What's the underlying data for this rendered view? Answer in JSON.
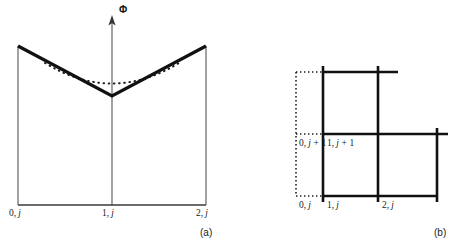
{
  "figure": {
    "panels": [
      {
        "id": "a",
        "caption": "(a)",
        "axis": {
          "vertical_label": "Φ",
          "arrow": "up-arrow-icon"
        },
        "node_labels": [
          {
            "name": "node-0-j",
            "index": "0,",
            "sub": "j"
          },
          {
            "name": "node-1-j",
            "index": "1,",
            "sub": "j"
          },
          {
            "name": "node-2-j",
            "index": "2,",
            "sub": "j"
          }
        ],
        "curves": [
          {
            "name": "piecewise-linear-solution",
            "style": "solid",
            "shape": "v-shape"
          },
          {
            "name": "smooth-exact-solution",
            "style": "dotted",
            "shape": "parabola"
          }
        ]
      },
      {
        "id": "b",
        "caption": "(b)",
        "node_labels": [
          {
            "name": "node-0-jplus1",
            "index": "0,",
            "sub": "j",
            "suffix": " + 1"
          },
          {
            "name": "node-1-jplus1",
            "index": "1,",
            "sub": "j",
            "suffix": " + 1"
          },
          {
            "name": "node-0-j",
            "index": "0,",
            "sub": "j",
            "suffix": ""
          },
          {
            "name": "node-1-j",
            "index": "1,",
            "sub": "j",
            "suffix": ""
          },
          {
            "name": "node-2-j",
            "index": "2,",
            "sub": "j",
            "suffix": ""
          }
        ],
        "grid": {
          "solid_style": "solid",
          "ghost_style": "dotted"
        }
      }
    ],
    "colors": {
      "ink": "#1a1a1a",
      "thin_line": "#55555a",
      "thick_line": "#111111",
      "background": "#ffffff"
    }
  }
}
